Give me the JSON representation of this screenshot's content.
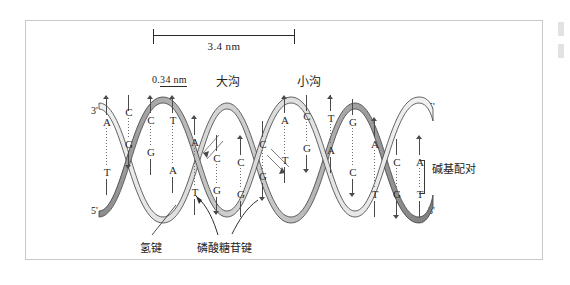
{
  "figure": {
    "language": "zh-CN"
  },
  "scale": {
    "major_length_label": "3.4  nm",
    "rise_label_prefix": "0.",
    "rise_label_underlined": "34  nm",
    "rise_label_full": "0.34  nm"
  },
  "grooves": {
    "major": "大沟",
    "minor": "小沟"
  },
  "strand_ends": {
    "left_top": "3'",
    "left_bottom": "5'",
    "right_top": "5'",
    "right_bottom": "3'"
  },
  "annotations": {
    "base_pair": "碱基配对",
    "hydrogen_bond": "氢键",
    "phosphodiester_bond": "磷酸糖苷键"
  },
  "colors": {
    "ribbon_dark": "#8a8a8a",
    "ribbon_light": "#e8e8e8",
    "outline": "#3a3a3a",
    "text": "#222222",
    "frame": "#c9c9c9",
    "background": "#ffffff"
  },
  "base_pairs": [
    {
      "x": 12,
      "top": "A",
      "bottom": "T",
      "top_y": 22,
      "bottom_y": 72,
      "dir": "up"
    },
    {
      "x": 34,
      "top": "C",
      "bottom": "G",
      "top_y": 12,
      "bottom_y": 44,
      "dir": "down"
    },
    {
      "x": 56,
      "top": "C",
      "bottom": "G",
      "top_y": 20,
      "bottom_y": 52,
      "dir": "up"
    },
    {
      "x": 78,
      "top": "T",
      "bottom": "A",
      "top_y": 20,
      "bottom_y": 70,
      "dir": "up"
    },
    {
      "x": 100,
      "top": "A",
      "bottom": "T",
      "top_y": 42,
      "bottom_y": 92,
      "dir": "up"
    },
    {
      "x": 122,
      "top": "C",
      "bottom": "G",
      "top_y": 58,
      "bottom_y": 90,
      "dir": "down"
    },
    {
      "x": 146,
      "top": "C",
      "bottom": "G",
      "top_y": 62,
      "bottom_y": 94,
      "dir": "up"
    },
    {
      "x": 168,
      "top": "C",
      "bottom": "G",
      "top_y": 44,
      "bottom_y": 76,
      "dir": "down"
    },
    {
      "x": 190,
      "top": "A",
      "bottom": "T",
      "top_y": 20,
      "bottom_y": 60,
      "dir": "up"
    },
    {
      "x": 212,
      "top": "C",
      "bottom": "G",
      "top_y": 16,
      "bottom_y": 48,
      "dir": "down"
    },
    {
      "x": 236,
      "top": "T",
      "bottom": "A",
      "top_y": 18,
      "bottom_y": 50,
      "dir": "up"
    },
    {
      "x": 258,
      "top": "G",
      "bottom": "C",
      "top_y": 22,
      "bottom_y": 72,
      "dir": "down"
    },
    {
      "x": 280,
      "top": "A",
      "bottom": "T",
      "top_y": 44,
      "bottom_y": 94,
      "dir": "up"
    },
    {
      "x": 302,
      "top": "C",
      "bottom": "G",
      "top_y": 62,
      "bottom_y": 94,
      "dir": "down"
    },
    {
      "x": 325,
      "top": "A",
      "bottom": "T",
      "top_y": 62,
      "bottom_y": 94,
      "dir": "up"
    }
  ]
}
